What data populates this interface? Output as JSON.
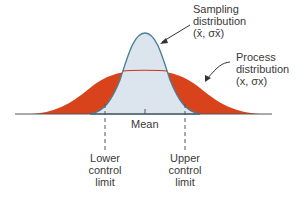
{
  "labels": {
    "sampling": {
      "line1": "Sampling",
      "line2": "distribution",
      "line3": "(x̄, σx̄)"
    },
    "process": {
      "line1": "Process",
      "line2": "distribution",
      "line3": "(x, σx)"
    },
    "mean": "Mean",
    "lower": {
      "line1": "Lower",
      "line2": "control",
      "line3": "limit"
    },
    "upper": {
      "line1": "Upper",
      "line2": "control",
      "line3": "limit"
    }
  },
  "colors": {
    "process_fill": "#d9431c",
    "sampling_fill": "#dce4ee",
    "sampling_stroke": "#4a7f97",
    "process_stroke": "#c9381a",
    "axis": "#555555"
  }
}
